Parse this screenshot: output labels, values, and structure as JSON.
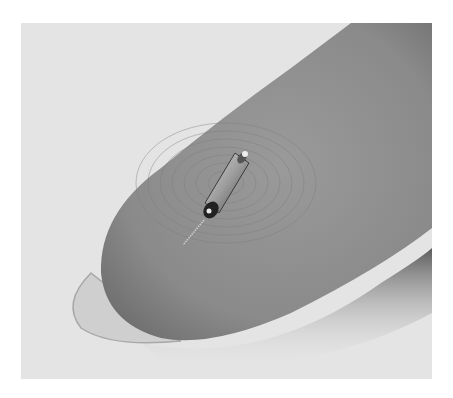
{
  "image": {
    "subject": "tiny cylindrical device with a thin wire lead resting on a fingertip",
    "colors": {
      "background": "#e4e4e4",
      "finger": "#8f8f8f",
      "finger_dark": "#6a6a6a",
      "nail": "#c9c9c9",
      "device_metal": "#b5b5b5",
      "device_dark": "#2a2a2a"
    }
  }
}
